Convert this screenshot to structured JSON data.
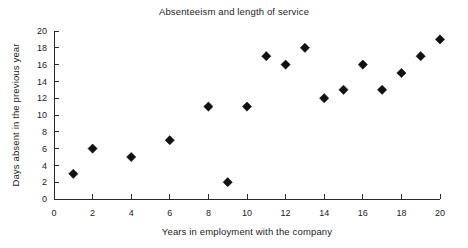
{
  "chart_data": {
    "type": "scatter",
    "title": "Absenteeism and length of service",
    "xlabel": "Years in employment with the company",
    "ylabel": "Days absent in the previous year",
    "xlim": [
      0,
      20
    ],
    "ylim": [
      0,
      20
    ],
    "xticks": [
      0,
      2,
      4,
      6,
      8,
      10,
      12,
      14,
      16,
      18,
      20
    ],
    "yticks": [
      0,
      2,
      4,
      6,
      8,
      10,
      12,
      14,
      16,
      18,
      20
    ],
    "grid": false,
    "legend": null,
    "marker": "diamond",
    "marker_color": "#111111",
    "x": [
      1,
      2,
      4,
      6,
      8,
      9,
      10,
      11,
      12,
      13,
      14,
      15,
      16,
      17,
      18,
      19,
      20
    ],
    "y": [
      3,
      6,
      5,
      7,
      11,
      2,
      11,
      17,
      16,
      18,
      12,
      13,
      16,
      13,
      15,
      17,
      19
    ],
    "points": [
      {
        "x": 1,
        "y": 3
      },
      {
        "x": 2,
        "y": 6
      },
      {
        "x": 4,
        "y": 5
      },
      {
        "x": 6,
        "y": 7
      },
      {
        "x": 8,
        "y": 11
      },
      {
        "x": 9,
        "y": 2
      },
      {
        "x": 10,
        "y": 11
      },
      {
        "x": 11,
        "y": 17
      },
      {
        "x": 12,
        "y": 16
      },
      {
        "x": 13,
        "y": 18
      },
      {
        "x": 14,
        "y": 12
      },
      {
        "x": 15,
        "y": 13
      },
      {
        "x": 16,
        "y": 16
      },
      {
        "x": 17,
        "y": 13
      },
      {
        "x": 18,
        "y": 15
      },
      {
        "x": 19,
        "y": 17
      },
      {
        "x": 20,
        "y": 19
      }
    ]
  }
}
